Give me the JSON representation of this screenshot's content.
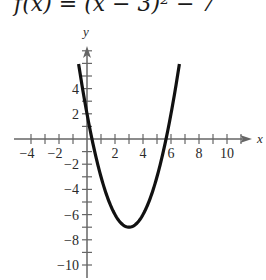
{
  "chart_data": {
    "type": "line",
    "title": "f(x) = (x − 3)² − 7",
    "function": "(x - 3)^2 - 7",
    "xlabel": "x",
    "ylabel": "y",
    "xlim": [
      -5,
      12
    ],
    "ylim": [
      -10.5,
      7.5
    ],
    "x_ticks": [
      -4,
      -3,
      -2,
      -1,
      1,
      2,
      3,
      4,
      5,
      6,
      7,
      8,
      9,
      10,
      11
    ],
    "x_tick_labels": [
      -4,
      -2,
      2,
      4,
      6,
      8,
      10
    ],
    "y_ticks": [
      -10,
      -9,
      -8,
      -7,
      -6,
      -5,
      -4,
      -3,
      -2,
      -1,
      1,
      2,
      3,
      4,
      5,
      6,
      7
    ],
    "y_tick_labels": [
      -10,
      -8,
      -6,
      -4,
      -2,
      2,
      4
    ],
    "curve_domain": [
      -0.6,
      6.6
    ],
    "vertex": [
      3,
      -7
    ],
    "grid": false,
    "legend": "none"
  }
}
